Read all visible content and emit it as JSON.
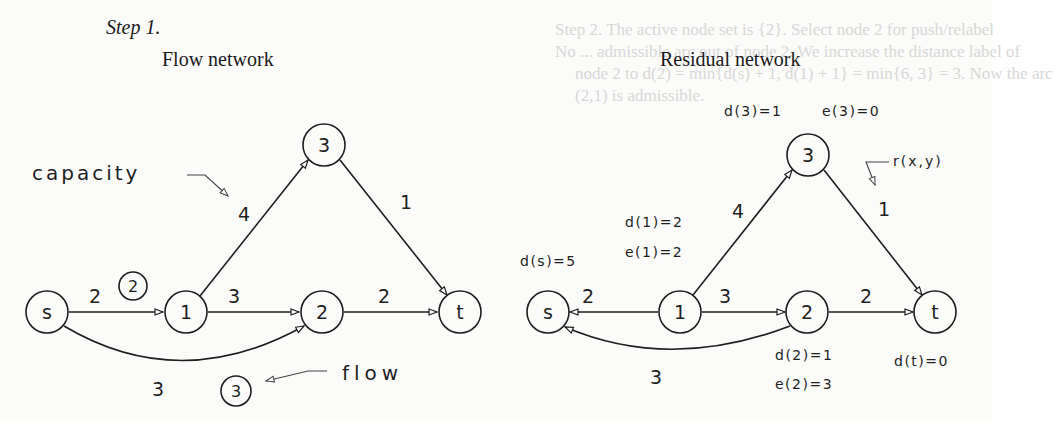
{
  "step_label": "Step 1.",
  "bleed_through": {
    "line1": "Step 2. The active node set is {2}. Select node 2 for push/relabel",
    "line2": "No ... admissible arc out of node 2. We increase the distance label of",
    "line3": "node 2 to d(2) = min{d(s) + 1, d(1) + 1} = min{6, 3} = 3. Now the arc",
    "line4": "(2,1) is admissible."
  },
  "flow_network": {
    "title": "Flow network",
    "nodes": [
      {
        "id": "s",
        "label": "s"
      },
      {
        "id": "1",
        "label": "1"
      },
      {
        "id": "2",
        "label": "2"
      },
      {
        "id": "3",
        "label": "3"
      },
      {
        "id": "t",
        "label": "t"
      }
    ],
    "edges": [
      {
        "from": "s",
        "to": "1",
        "capacity": "2",
        "flow": "2"
      },
      {
        "from": "s",
        "to": "2",
        "capacity": "3",
        "flow": "3"
      },
      {
        "from": "1",
        "to": "2",
        "capacity": "3"
      },
      {
        "from": "1",
        "to": "3",
        "capacity": "4"
      },
      {
        "from": "2",
        "to": "t",
        "capacity": "2"
      },
      {
        "from": "3",
        "to": "t",
        "capacity": "1"
      }
    ],
    "annotations": {
      "capacity": "capacity",
      "flow": "flow"
    }
  },
  "residual_network": {
    "title": "Residual network",
    "nodes": [
      {
        "id": "s",
        "label": "s",
        "d": "d(s)=5"
      },
      {
        "id": "1",
        "label": "1",
        "d": "d(1)=2",
        "e": "e(1)=2"
      },
      {
        "id": "2",
        "label": "2",
        "d": "d(2)=1",
        "e": "e(2)=3"
      },
      {
        "id": "3",
        "label": "3",
        "d": "d(3)=1",
        "e": "e(3)=0"
      },
      {
        "id": "t",
        "label": "t",
        "d": "d(t)=0"
      }
    ],
    "edges": [
      {
        "from": "1",
        "to": "s",
        "residual": "2"
      },
      {
        "from": "2",
        "to": "s",
        "residual": "3"
      },
      {
        "from": "1",
        "to": "2",
        "residual": "3"
      },
      {
        "from": "1",
        "to": "3",
        "residual": "4"
      },
      {
        "from": "2",
        "to": "t",
        "residual": "2"
      },
      {
        "from": "3",
        "to": "t",
        "residual": "1"
      }
    ],
    "annotations": {
      "residual": "r(x,y)"
    }
  }
}
